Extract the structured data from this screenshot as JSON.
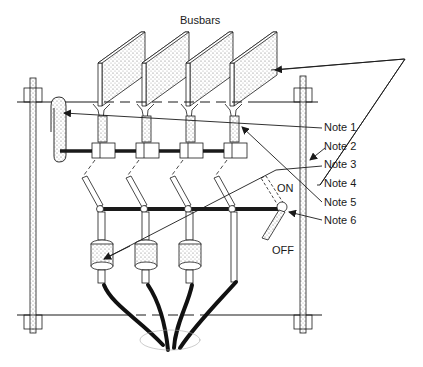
{
  "diagram": {
    "title": "Busbars",
    "switch_states": {
      "on": "ON",
      "off": "OFF"
    },
    "notes": [
      {
        "id": "note-1",
        "label": "Note 1"
      },
      {
        "id": "note-2",
        "label": "Note 2"
      },
      {
        "id": "note-3",
        "label": "Note 3"
      },
      {
        "id": "note-4",
        "label": "Note 4"
      },
      {
        "id": "note-5",
        "label": "Note 5"
      },
      {
        "id": "note-6",
        "label": "Note 6"
      }
    ],
    "busbar_count": 4,
    "fuse_count": 3,
    "cable_count": 4,
    "colors": {
      "line": "#1a1a1a",
      "fill_stipple": "#cfcfcf",
      "background": "#ffffff"
    }
  }
}
